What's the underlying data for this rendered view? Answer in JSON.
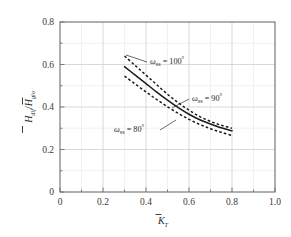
{
  "figure": {
    "background_color": "#ffffff",
    "frame_color": "#6e6e6e",
    "grid_color": "#d9d9d9",
    "curve_color": "#1a1a1a"
  },
  "axes": {
    "x": {
      "label_main": "K",
      "label_sub": "T",
      "label_full": "K̄_T",
      "ticks": [
        "0",
        "0.2",
        "0.4",
        "0.6",
        "0.8",
        "1.0"
      ],
      "tick_values": [
        0,
        0.2,
        0.4,
        0.6,
        0.8,
        1.0
      ],
      "range": [
        0,
        1.0
      ],
      "minor_step": 0.1
    },
    "y": {
      "label_num_main": "H",
      "label_num_sub": "dif",
      "label_den_main": "H",
      "label_den_sub": "glo",
      "label_full": "H̄_dif/H̄_glo",
      "separator": "/",
      "ticks": [
        "0",
        "0.2",
        "0.4",
        "0.6",
        "0.8"
      ],
      "tick_values": [
        0,
        0.2,
        0.4,
        0.6,
        0.8
      ],
      "range": [
        0,
        0.8
      ],
      "minor_step": 0.1
    }
  },
  "annotations": [
    {
      "id": "omega-100",
      "symbol": "ω",
      "subscript": "ss",
      "equals": " = ",
      "value": "100",
      "degree": "°",
      "text": "ωss = 100°",
      "x": 150,
      "y": 64
    },
    {
      "id": "omega-90",
      "symbol": "ω",
      "subscript": "ss",
      "equals": " = ",
      "value": "90",
      "degree": "°",
      "text": "ωss = 90°",
      "x": 192,
      "y": 101
    },
    {
      "id": "omega-80",
      "symbol": "ω",
      "subscript": "ss",
      "equals": " = ",
      "value": "80",
      "degree": "°",
      "text": "ωss = 80°",
      "x": 114,
      "y": 132
    }
  ],
  "chart_data": {
    "type": "line",
    "title": "",
    "xlabel": "K̄_T",
    "ylabel": "H̄_dif / H̄_glo",
    "xlim": [
      0,
      1.0
    ],
    "ylim": [
      0,
      0.8
    ],
    "xticks": [
      0,
      0.2,
      0.4,
      0.6,
      0.8,
      1.0
    ],
    "yticks": [
      0,
      0.2,
      0.4,
      0.6,
      0.8
    ],
    "grid": true,
    "legend": "inline-annotations",
    "series": [
      {
        "name": "ωss = 100°",
        "style": "dashed",
        "x": [
          0.3,
          0.35,
          0.4,
          0.45,
          0.5,
          0.55,
          0.6,
          0.65,
          0.7,
          0.75,
          0.8
        ],
        "values": [
          0.64,
          0.595,
          0.55,
          0.505,
          0.46,
          0.42,
          0.385,
          0.355,
          0.332,
          0.314,
          0.3
        ]
      },
      {
        "name": "ωss = 90°",
        "style": "solid",
        "x": [
          0.3,
          0.35,
          0.4,
          0.45,
          0.5,
          0.55,
          0.6,
          0.65,
          0.7,
          0.75,
          0.8
        ],
        "values": [
          0.59,
          0.55,
          0.51,
          0.47,
          0.432,
          0.397,
          0.366,
          0.34,
          0.32,
          0.302,
          0.288
        ]
      },
      {
        "name": "ωss = 80°",
        "style": "dashed",
        "x": [
          0.3,
          0.35,
          0.4,
          0.45,
          0.5,
          0.55,
          0.6,
          0.65,
          0.7,
          0.75,
          0.8
        ],
        "values": [
          0.545,
          0.508,
          0.471,
          0.435,
          0.401,
          0.37,
          0.342,
          0.318,
          0.298,
          0.281,
          0.266
        ]
      }
    ]
  }
}
